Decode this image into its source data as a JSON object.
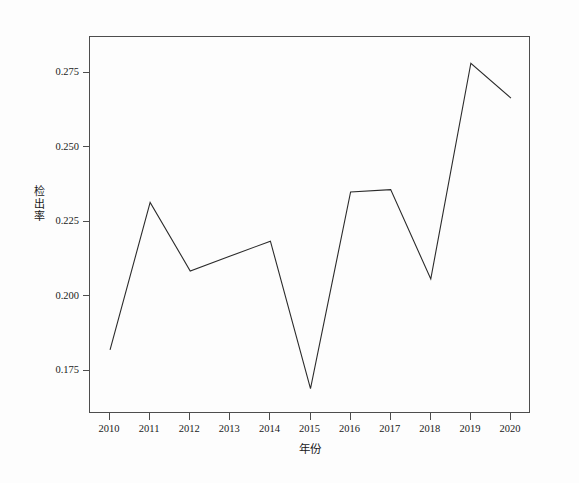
{
  "chart_data": {
    "type": "line",
    "title": "",
    "xlabel": "年份",
    "ylabel": "检出率",
    "categories": [
      "2010",
      "2011",
      "2012",
      "2013",
      "2014",
      "2015",
      "2016",
      "2017",
      "2018",
      "2019",
      "2020"
    ],
    "x": [
      2010,
      2011,
      2012,
      2013,
      2014,
      2015,
      2016,
      2017,
      2018,
      2019,
      2020
    ],
    "values": [
      0.182,
      0.2315,
      0.2085,
      0.2135,
      0.2185,
      0.169,
      0.235,
      0.2358,
      0.2058,
      0.2782,
      0.2665
    ],
    "series": [
      {
        "name": "检出率",
        "values": [
          0.182,
          0.2315,
          0.2085,
          0.2135,
          0.2185,
          0.169,
          0.235,
          0.2358,
          0.2058,
          0.2782,
          0.2665
        ]
      }
    ],
    "ylim": [
      0.1605,
      0.287
    ],
    "xlim": [
      2009.5,
      2020.5
    ],
    "ytick_labels": [
      "0.275",
      "0.250",
      "0.225",
      "0.200",
      "0.175"
    ],
    "ytick_values": [
      0.275,
      0.25,
      0.225,
      0.2,
      0.175
    ],
    "grid": false,
    "legend": false,
    "legend_position": "none",
    "line_color": "#2b2b2b",
    "line_width": 1.1,
    "markers": false,
    "frame_color": "#4d4d4d",
    "background_color": "#fdfdfd"
  }
}
